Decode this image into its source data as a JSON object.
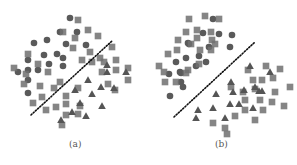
{
  "figure": {
    "panel_labels": [
      "(a)",
      "(b)"
    ],
    "caption": "",
    "colors": {
      "marker": "#707070",
      "boundary": "#111111",
      "background": "#ffffff"
    }
  },
  "chart_data": [
    {
      "type": "scatter",
      "title": "(a)",
      "xlabel": "",
      "ylabel": "",
      "grid": false,
      "legend": "none",
      "note": "Pixel coordinates within 297x165 figure; dotted line is a linear decision boundary",
      "boundary": {
        "x1": 31,
        "y1": 115,
        "x2": 112,
        "y2": 41,
        "style": "dotted"
      },
      "series": [
        {
          "name": "circle",
          "marker": "circle",
          "points": [
            [
              70,
              18
            ],
            [
              60,
              32
            ],
            [
              77,
              32
            ],
            [
              34,
              43
            ],
            [
              47,
              40
            ],
            [
              66,
              44
            ],
            [
              86,
              45
            ],
            [
              28,
              60
            ],
            [
              44,
              55
            ],
            [
              57,
              54
            ],
            [
              63,
              58
            ],
            [
              49,
              64
            ],
            [
              63,
              66
            ],
            [
              28,
              70
            ],
            [
              38,
              70
            ],
            [
              18,
              72
            ],
            [
              28,
              80
            ],
            [
              28,
              93
            ]
          ]
        },
        {
          "name": "square",
          "marker": "square",
          "points": [
            [
              78,
              20
            ],
            [
              63,
              32
            ],
            [
              88,
              30
            ],
            [
              98,
              36
            ],
            [
              75,
              38
            ],
            [
              73,
              48
            ],
            [
              90,
              52
            ],
            [
              28,
              54
            ],
            [
              38,
              64
            ],
            [
              48,
              72
            ],
            [
              14,
              68
            ],
            [
              26,
              74
            ],
            [
              24,
              84
            ],
            [
              40,
              86
            ],
            [
              54,
              88
            ],
            [
              60,
              82
            ],
            [
              42,
              97
            ],
            [
              33,
              103
            ],
            [
              46,
              110
            ],
            [
              56,
              107
            ],
            [
              66,
              104
            ],
            [
              66,
              96
            ],
            [
              78,
              88
            ],
            [
              82,
              60
            ],
            [
              92,
              62
            ],
            [
              100,
              58
            ],
            [
              104,
              62
            ],
            [
              112,
              47
            ],
            [
              116,
              60
            ],
            [
              116,
              70
            ],
            [
              128,
              68
            ],
            [
              128,
              80
            ],
            [
              102,
              72
            ],
            [
              108,
              84
            ],
            [
              115,
              90
            ],
            [
              66,
              115
            ],
            [
              80,
              106
            ],
            [
              62,
              125
            ],
            [
              78,
              114
            ]
          ]
        },
        {
          "name": "triangle",
          "marker": "triangle",
          "points": [
            [
              107,
              65
            ],
            [
              126,
              72
            ],
            [
              88,
              80
            ],
            [
              101,
              87
            ],
            [
              75,
              90
            ],
            [
              92,
              94
            ],
            [
              80,
              103
            ],
            [
              114,
              88
            ],
            [
              102,
              106
            ],
            [
              72,
              112
            ],
            [
              86,
              116
            ],
            [
              61,
              120
            ],
            [
              107,
              72
            ]
          ]
        }
      ]
    },
    {
      "type": "scatter",
      "title": "(b)",
      "xlabel": "",
      "ylabel": "",
      "grid": false,
      "legend": "none",
      "note": "Pixel coordinates within 297x165 figure; dotted line is a linear decision boundary",
      "boundary": {
        "x1": 174,
        "y1": 117,
        "x2": 255,
        "y2": 42,
        "style": "dotted"
      },
      "series": [
        {
          "name": "circle",
          "marker": "circle",
          "points": [
            [
              213,
              19
            ],
            [
              203,
              33
            ],
            [
              219,
              34
            ],
            [
              232,
              35
            ],
            [
              189,
              44
            ],
            [
              188,
              43
            ],
            [
              209,
              47
            ],
            [
              230,
              47
            ],
            [
              176,
              62
            ],
            [
              186,
              58
            ],
            [
              199,
              56
            ],
            [
              206,
              62
            ],
            [
              180,
              72
            ],
            [
              181,
              73
            ],
            [
              169,
              74
            ],
            [
              181,
              82
            ],
            [
              183,
              87
            ],
            [
              170,
              96
            ],
            [
              196,
              66
            ]
          ]
        },
        {
          "name": "square",
          "marker": "square",
          "points": [
            [
              189,
              19
            ],
            [
              205,
              16
            ],
            [
              219,
              19
            ],
            [
              186,
              32
            ],
            [
              197,
              30
            ],
            [
              211,
              32
            ],
            [
              212,
              40
            ],
            [
              178,
              40
            ],
            [
              191,
              44
            ],
            [
              197,
              38
            ],
            [
              215,
              44
            ],
            [
              211,
              50
            ],
            [
              168,
              54
            ],
            [
              177,
              50
            ],
            [
              200,
              50
            ],
            [
              199,
              64
            ],
            [
              188,
              70
            ],
            [
              186,
              73
            ],
            [
              159,
              66
            ],
            [
              164,
              72
            ],
            [
              165,
              82
            ],
            [
              176,
              82
            ],
            [
              231,
              87
            ],
            [
              248,
              70
            ],
            [
              266,
              66
            ],
            [
              280,
              69
            ],
            [
              290,
              87
            ],
            [
              262,
              80
            ],
            [
              253,
              80
            ],
            [
              255,
              89
            ],
            [
              273,
              78
            ],
            [
              275,
              92
            ],
            [
              272,
              102
            ],
            [
              243,
              92
            ],
            [
              245,
              100
            ],
            [
              245,
              110
            ],
            [
              263,
              110
            ],
            [
              260,
              100
            ],
            [
              284,
              106
            ],
            [
              235,
              116
            ],
            [
              255,
              120
            ],
            [
              225,
              128
            ],
            [
              213,
              123
            ],
            [
              227,
              134
            ]
          ]
        },
        {
          "name": "triangle",
          "marker": "triangle",
          "points": [
            [
              250,
              66
            ],
            [
              270,
              72
            ],
            [
              231,
              82
            ],
            [
              216,
              94
            ],
            [
              233,
              92
            ],
            [
              244,
              90
            ],
            [
              255,
              87
            ],
            [
              259,
              91
            ],
            [
              262,
              91
            ],
            [
              239,
              104
            ],
            [
              213,
              108
            ],
            [
              253,
              108
            ],
            [
              198,
              110
            ],
            [
              225,
              118
            ],
            [
              196,
              118
            ],
            [
              230,
              104
            ]
          ]
        }
      ]
    }
  ]
}
